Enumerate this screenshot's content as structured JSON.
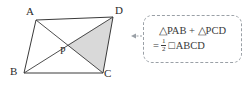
{
  "diagram": {
    "type": "geometry-parallelogram",
    "shape_name": "ABCD",
    "vertices": [
      {
        "label": "A",
        "x": 36,
        "y": 20
      },
      {
        "label": "D",
        "x": 113,
        "y": 17
      },
      {
        "label": "C",
        "x": 103,
        "y": 73
      },
      {
        "label": "B",
        "x": 24,
        "y": 73
      }
    ],
    "intersection_point": {
      "label": "P",
      "x": 67,
      "y": 45
    },
    "diagonals": [
      {
        "from": "A",
        "to": "C"
      },
      {
        "from": "B",
        "to": "D"
      }
    ],
    "shaded_region": {
      "name": "triangle-PDC",
      "points": "P,D,C",
      "fill": "#d9d9d9"
    },
    "stroke_color": "#3a3a3a",
    "labels": {
      "A": "A",
      "B": "B",
      "C": "C",
      "D": "D",
      "P": "P"
    }
  },
  "callout": {
    "border_color": "#9aa0a6",
    "connector": "dashed-arrow-left",
    "formula_line_1": "△PAB + △PCD",
    "formula_line_2": {
      "equals": "=",
      "numerator": "1",
      "denominator": "2",
      "square_symbol": "□",
      "shape": "ABCD"
    },
    "formula_full": "△PAB + △PCD = ½ □ABCD"
  }
}
